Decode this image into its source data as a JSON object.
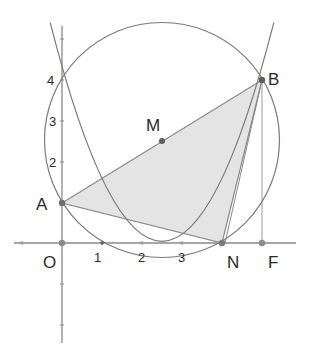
{
  "figure": {
    "colors": {
      "background": "#ffffff",
      "stroke": "#7a7a7a",
      "axis": "#8a8a8a",
      "triangle_fill": "#e4e4e4",
      "point": "#6e6e6e",
      "text": "#2a2a2a"
    },
    "axes": {
      "x_ticks": [
        {
          "label": "1",
          "value": 1
        },
        {
          "label": "2",
          "value": 2
        },
        {
          "label": "3",
          "value": 3
        }
      ],
      "y_ticks": [
        {
          "label": "2",
          "value": 2
        },
        {
          "label": "3",
          "value": 3
        },
        {
          "label": "4",
          "value": 4
        }
      ]
    },
    "points": {
      "O": {
        "label": "O",
        "x": 0,
        "y": 0
      },
      "A": {
        "label": "A",
        "x": 0,
        "y": 1
      },
      "B": {
        "label": "B",
        "x": 5,
        "y": 4
      },
      "N": {
        "label": "N",
        "x": 4,
        "y": 0
      },
      "F": {
        "label": "F",
        "x": 5,
        "y": 0
      },
      "M": {
        "label": "M",
        "x": 2.5,
        "y": 2.5
      }
    },
    "curves": {
      "parabola": "y = x^2 - 5x + 4",
      "circle": {
        "center": "M",
        "through": [
          "A",
          "B",
          "N"
        ]
      }
    },
    "shapes": {
      "triangle": [
        "A",
        "B",
        "N"
      ]
    }
  }
}
